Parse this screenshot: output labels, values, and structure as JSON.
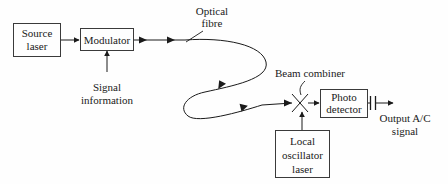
{
  "diagram": {
    "background_color": "#fefefe",
    "line_color": "#1a1a1a",
    "box_stroke_color": "#3a3a3a",
    "blocks": [
      {
        "id": "source-laser",
        "label_line1": "Source",
        "label_line2": "laser"
      },
      {
        "id": "modulator",
        "label_line1": "Modulator",
        "label_line2": ""
      },
      {
        "id": "photo-detector",
        "label_line1": "Photo",
        "label_line2": "detector"
      },
      {
        "id": "local-oscillator",
        "label_line1": "Local",
        "label_line2": "oscillator",
        "label_line3": "laser"
      }
    ],
    "annotations": [
      {
        "id": "optical-fibre",
        "line1": "Optical",
        "line2": "fibre"
      },
      {
        "id": "signal-information",
        "line1": "Signal",
        "line2": "information"
      },
      {
        "id": "beam-combiner",
        "line1": "Beam combiner",
        "line2": ""
      },
      {
        "id": "output-signal",
        "line1": "Output A/C",
        "line2": "signal"
      }
    ],
    "symbols": [
      {
        "id": "beam-combiner-x",
        "name": "beam-combiner-cross"
      },
      {
        "id": "coupling-capacitor",
        "name": "capacitor"
      }
    ]
  }
}
